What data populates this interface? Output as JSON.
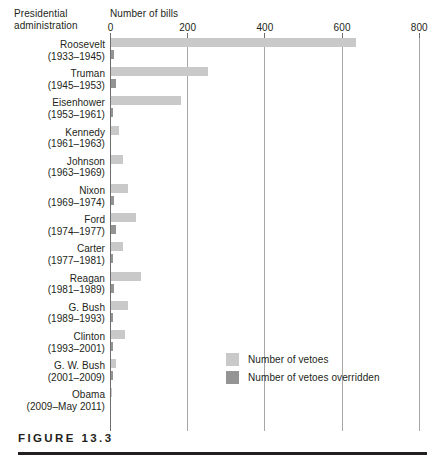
{
  "header": {
    "row_axis_title_line1": "Presidential",
    "row_axis_title_line2": "administration",
    "value_axis_title": "Number of bills"
  },
  "caption": {
    "label": "FIGURE 13.3"
  },
  "legend": {
    "position": "inside-bottom-right",
    "items": [
      {
        "label": "Number of vetoes",
        "color": "#c9c9c9"
      },
      {
        "label": "Number of vetoes overridden",
        "color": "#949494"
      }
    ]
  },
  "colors": {
    "vetoes": "#c9c9c9",
    "overridden": "#949494",
    "axis": "#6e6e6e",
    "grid": "#a7a7a7",
    "text": "#231f20"
  },
  "chart_data": {
    "type": "bar",
    "orientation": "horizontal",
    "title": "",
    "xlabel": "Number of bills",
    "ylabel": "Presidential administration",
    "xlim": [
      0,
      800
    ],
    "xticks": [
      0,
      200,
      400,
      600,
      800
    ],
    "xtick_labels": [
      "0",
      "200",
      "400",
      "600",
      "800"
    ],
    "grid": true,
    "legend_position": "inside-bottom-right",
    "categories": [
      "Roosevelt (1933–1945)",
      "Truman (1945–1953)",
      "Eisenhower (1953–1961)",
      "Kennedy (1961–1963)",
      "Johnson (1963–1969)",
      "Nixon (1969–1974)",
      "Ford (1974–1977)",
      "Carter (1977–1981)",
      "Reagan (1981–1989)",
      "G. Bush (1989–1993)",
      "Clinton (1993–2001)",
      "G. W. Bush (2001–2009)",
      "Obama (2009–May 2011)"
    ],
    "series": [
      {
        "name": "Number of vetoes",
        "color": "#c9c9c9",
        "values": [
          635,
          250,
          181,
          21,
          30,
          43,
          66,
          31,
          78,
          44,
          37,
          12,
          2
        ]
      },
      {
        "name": "Number of vetoes overridden",
        "color": "#949494",
        "values": [
          9,
          12,
          2,
          0,
          0,
          7,
          12,
          2,
          9,
          1,
          2,
          4,
          0
        ]
      }
    ]
  },
  "rows": [
    {
      "name": "Roosevelt",
      "years": "(1933–1945)",
      "vetoes": 635,
      "overridden": 9
    },
    {
      "name": "Truman",
      "years": "(1945–1953)",
      "vetoes": 250,
      "overridden": 12
    },
    {
      "name": "Eisenhower",
      "years": "(1953–1961)",
      "vetoes": 181,
      "overridden": 2
    },
    {
      "name": "Kennedy",
      "years": "(1961–1963)",
      "vetoes": 21,
      "overridden": 0
    },
    {
      "name": "Johnson",
      "years": "(1963–1969)",
      "vetoes": 30,
      "overridden": 0
    },
    {
      "name": "Nixon",
      "years": "(1969–1974)",
      "vetoes": 43,
      "overridden": 7
    },
    {
      "name": "Ford",
      "years": "(1974–1977)",
      "vetoes": 66,
      "overridden": 12
    },
    {
      "name": "Carter",
      "years": "(1977–1981)",
      "vetoes": 31,
      "overridden": 2
    },
    {
      "name": "Reagan",
      "years": "(1981–1989)",
      "vetoes": 78,
      "overridden": 9
    },
    {
      "name": "G. Bush",
      "years": "(1989–1993)",
      "vetoes": 44,
      "overridden": 1
    },
    {
      "name": "Clinton",
      "years": "(1993–2001)",
      "vetoes": 37,
      "overridden": 2
    },
    {
      "name": "G. W. Bush",
      "years": "(2001–2009)",
      "vetoes": 12,
      "overridden": 4
    },
    {
      "name": "Obama",
      "years": "(2009–May 2011)",
      "vetoes": 2,
      "overridden": 0
    }
  ]
}
